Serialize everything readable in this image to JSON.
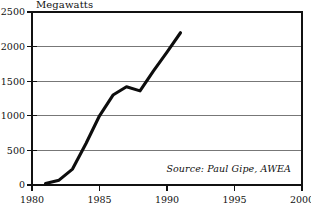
{
  "chart_data": {
    "type": "line",
    "title": "Megawatts",
    "xlabel": "",
    "ylabel": "Megawatts",
    "xlim": [
      1980,
      2000
    ],
    "ylim": [
      0,
      2500
    ],
    "grid": "horizontal",
    "legend": "none",
    "annotation": "Source: Paul Gipe, AWEA",
    "ytick_labels": [
      "0",
      "500",
      "1000",
      "1500",
      "2000",
      "2500"
    ],
    "ytick_values": [
      0,
      500,
      1000,
      1500,
      2000,
      2500
    ],
    "xtick_labels": [
      "1980",
      "1985",
      "1990",
      "1995",
      "2000"
    ],
    "xtick_values": [
      1980,
      1985,
      1990,
      1995,
      2000
    ],
    "x": [
      1981,
      1982,
      1983,
      1984,
      1985,
      1986,
      1987,
      1988,
      1989,
      1990,
      1991
    ],
    "values": [
      20,
      70,
      230,
      600,
      1000,
      1300,
      1420,
      1360,
      1650,
      1920,
      2200
    ],
    "series": [
      {
        "name": "Installed wind capacity",
        "values": [
          20,
          70,
          230,
          600,
          1000,
          1300,
          1420,
          1360,
          1650,
          1920,
          2200
        ]
      }
    ],
    "colors": {
      "line": "#0d0d0d",
      "grid": "#555555",
      "frame": "#111111",
      "background": "#ffffff"
    }
  }
}
